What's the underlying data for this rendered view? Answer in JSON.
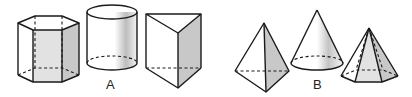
{
  "figure": {
    "groups": [
      {
        "label": "A",
        "solids": [
          {
            "name": "hexagonal prism"
          },
          {
            "name": "cylinder"
          },
          {
            "name": "triangular prism"
          }
        ]
      },
      {
        "label": "B",
        "solids": [
          {
            "name": "square pyramid"
          },
          {
            "name": "cone"
          },
          {
            "name": "hexagonal pyramid"
          }
        ]
      }
    ],
    "colors": {
      "edge": "#1a1a1a",
      "shade": "#c8c8c8",
      "light_shade": "#e2e2e2",
      "background": "#ffffff"
    }
  }
}
